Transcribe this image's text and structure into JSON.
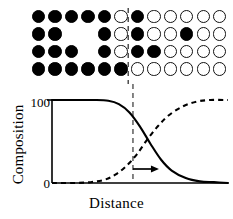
{
  "figure": {
    "name": "interdiffusion-concentration-profile",
    "lattice": {
      "name": "atom-lattice",
      "rows": 4,
      "columns": 12,
      "legend": {
        "filled": "solute-atom-A",
        "open": "solute-atom-B"
      },
      "cells": [
        [
          "filled",
          "filled",
          "filled",
          "filled",
          "filled",
          "open",
          "filled",
          "open",
          "open",
          "open",
          "open",
          "open"
        ],
        [
          "filled",
          "filled",
          "empty",
          "empty",
          "filled",
          "open",
          "filled",
          "open",
          "open",
          "filled",
          "open",
          "open"
        ],
        [
          "filled",
          "filled",
          "filled",
          "empty",
          "filled",
          "open",
          "filled",
          "filled",
          "open",
          "open",
          "open",
          "open"
        ],
        [
          "filled",
          "filled",
          "filled",
          "filled",
          "filled",
          "filled",
          "open",
          "open",
          "open",
          "open",
          "open",
          "open"
        ]
      ]
    },
    "interface": {
      "name": "original-interface-line",
      "style": "dashed",
      "column_fraction": 0.5
    },
    "arrow": {
      "name": "interface-shift-arrow",
      "direction": "right"
    }
  },
  "chart_data": {
    "type": "line",
    "title": "",
    "xlabel": "Distance",
    "ylabel": "Composition",
    "xlim": [
      0,
      1
    ],
    "ylim": [
      0,
      100
    ],
    "grid": false,
    "legend": "none",
    "ytick_labels": [
      "100",
      "0"
    ],
    "ytick_values": [
      100,
      0
    ],
    "xtick_labels": [],
    "interface_x": 0.46,
    "series": [
      {
        "name": "component-A-profile",
        "style": "solid",
        "x": [
          0.0,
          0.08,
          0.16,
          0.24,
          0.32,
          0.38,
          0.44,
          0.5,
          0.56,
          0.62,
          0.68,
          0.76,
          0.84,
          0.92,
          1.0
        ],
        "values": [
          100,
          100,
          100,
          100,
          99,
          95,
          85,
          68,
          47,
          28,
          15,
          6,
          2,
          1,
          0
        ]
      },
      {
        "name": "component-B-profile",
        "style": "dashed",
        "x": [
          0.0,
          0.12,
          0.22,
          0.3,
          0.36,
          0.42,
          0.48,
          0.54,
          0.6,
          0.66,
          0.74,
          0.82,
          0.9,
          1.0
        ],
        "values": [
          0,
          0,
          1,
          4,
          10,
          20,
          34,
          52,
          68,
          81,
          92,
          98,
          100,
          100
        ]
      }
    ]
  }
}
